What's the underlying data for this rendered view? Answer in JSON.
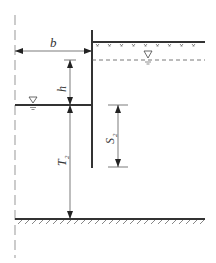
{
  "diagram": {
    "type": "sheet-pile cofferdam cross-section",
    "colors": {
      "line": "#333333",
      "thin": "#444444",
      "centerline": "#aaaaaa",
      "background": "#ffffff"
    },
    "labels": {
      "b": "b",
      "h": "h",
      "T": "T",
      "T_sub": "2",
      "S": "S",
      "S_sub": "2"
    },
    "symbols": {
      "water_level": "▽"
    }
  }
}
